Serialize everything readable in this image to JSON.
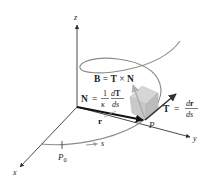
{
  "diagram": {
    "axes": {
      "x_label": "x",
      "y_label": "y",
      "z_label": "z"
    },
    "points": {
      "P_label": "P",
      "P0_label": "P",
      "P0_sub": "0"
    },
    "arc_label": "s",
    "position_vector_label": "r",
    "binormal": {
      "lhs": "B",
      "eq": " = ",
      "t": "T",
      "cross": " × ",
      "n": "N"
    },
    "normal": {
      "lhs": "N",
      "eq": "=",
      "frac1_num": "1",
      "frac1_den": "κ",
      "frac2_num_d": "d",
      "frac2_num_T": "T",
      "frac2_den": "ds"
    },
    "tangent": {
      "lhs": "T",
      "eq": "=",
      "num_d": "d",
      "num_r": "r",
      "den": "ds"
    },
    "colors": {
      "axis": "#333333",
      "curve": "#8a8a8a",
      "vector_r": "#111111",
      "vector_T": "#333333",
      "vector_N": "#b0b0b0",
      "box": "#cfcfcf",
      "text": "#222222"
    }
  }
}
